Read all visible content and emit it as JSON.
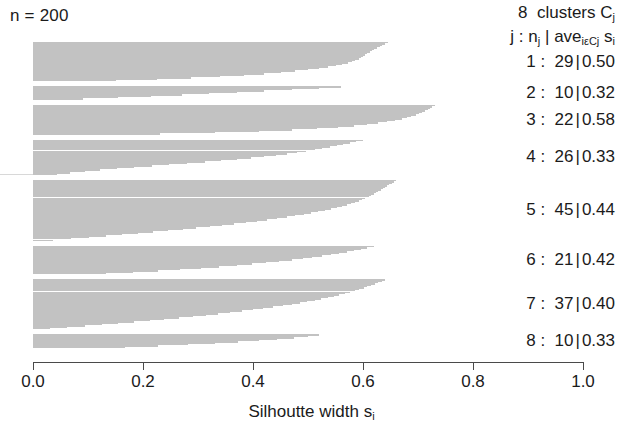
{
  "caption": {
    "n_label": "n = 200"
  },
  "legend": {
    "title_prefix": "8",
    "title_word": "clusters",
    "title_symbol": "C",
    "title_symbol_sub": "j",
    "header_j": "j",
    "header_colon": ":",
    "header_n": "n",
    "header_n_sub": "j",
    "header_bar": "|",
    "header_ave": "ave",
    "header_ave_sub": "iεCj",
    "header_s": "s",
    "header_s_sub": "i",
    "rows": [
      {
        "j": "1",
        "n": "29",
        "ave": "0.50"
      },
      {
        "j": "2",
        "n": "10",
        "ave": "0.32"
      },
      {
        "j": "3",
        "n": "22",
        "ave": "0.58"
      },
      {
        "j": "4",
        "n": "26",
        "ave": "0.33"
      },
      {
        "j": "5",
        "n": "45",
        "ave": "0.44"
      },
      {
        "j": "6",
        "n": "21",
        "ave": "0.42"
      },
      {
        "j": "7",
        "n": "37",
        "ave": "0.40"
      },
      {
        "j": "8",
        "n": "10",
        "ave": "0.33"
      }
    ]
  },
  "axis": {
    "title_text": "Silhoutte width s",
    "title_sub": "i",
    "ticks": [
      "0.0",
      "0.2",
      "0.4",
      "0.6",
      "0.8",
      "1.0"
    ],
    "tick_values": [
      0.0,
      0.2,
      0.4,
      0.6,
      0.8,
      1.0
    ],
    "min": 0.0,
    "max": 1.0
  },
  "colors": {
    "bar_fill": "#c2c2c2",
    "axis": "#4a4a4a",
    "text": "#1b1b1b",
    "background": "#ffffff"
  },
  "chart_data": {
    "type": "bar",
    "orientation": "horizontal",
    "title": "",
    "subtitle": "n = 200",
    "xlabel": "Silhoutte width s_i",
    "ylabel": "",
    "xlim": [
      0.0,
      1.0
    ],
    "grid": false,
    "legend_position": "right",
    "n_total": 200,
    "n_clusters": 8,
    "cluster_summary": [
      {
        "j": 1,
        "size": 29,
        "avg_silhouette": 0.5
      },
      {
        "j": 2,
        "size": 10,
        "avg_silhouette": 0.32
      },
      {
        "j": 3,
        "size": 22,
        "avg_silhouette": 0.58
      },
      {
        "j": 4,
        "size": 26,
        "avg_silhouette": 0.33
      },
      {
        "j": 5,
        "size": 45,
        "avg_silhouette": 0.44
      },
      {
        "j": 6,
        "size": 21,
        "avg_silhouette": 0.42
      },
      {
        "j": 7,
        "size": 37,
        "avg_silhouette": 0.4
      },
      {
        "j": 8,
        "size": 10,
        "avg_silhouette": 0.33
      }
    ],
    "clusters": [
      {
        "j": 1,
        "size": 29,
        "avg_silhouette": 0.5,
        "values": [
          0.645,
          0.64,
          0.635,
          0.63,
          0.625,
          0.62,
          0.616,
          0.612,
          0.608,
          0.604,
          0.6,
          0.596,
          0.592,
          0.586,
          0.58,
          0.572,
          0.562,
          0.55,
          0.536,
          0.52,
          0.5,
          0.476,
          0.45,
          0.42,
          0.384,
          0.34,
          0.288,
          0.226,
          0.15
        ]
      },
      {
        "j": 2,
        "size": 10,
        "avg_silhouette": 0.32,
        "values": [
          0.56,
          0.52,
          0.47,
          0.42,
          0.37,
          0.32,
          0.27,
          0.215,
          0.155,
          0.09
        ]
      },
      {
        "j": 3,
        "size": 22,
        "avg_silhouette": 0.58,
        "values": [
          0.73,
          0.726,
          0.722,
          0.718,
          0.713,
          0.708,
          0.702,
          0.696,
          0.688,
          0.68,
          0.67,
          0.658,
          0.644,
          0.628,
          0.608,
          0.584,
          0.554,
          0.516,
          0.47,
          0.41,
          0.33,
          0.23
        ]
      },
      {
        "j": 4,
        "size": 26,
        "avg_silhouette": 0.33,
        "values": [
          0.6,
          0.588,
          0.576,
          0.564,
          0.552,
          0.54,
          0.526,
          0.512,
          0.496,
          0.48,
          0.462,
          0.442,
          0.42,
          0.396,
          0.37,
          0.342,
          0.312,
          0.28,
          0.248,
          0.216,
          0.184,
          0.152,
          0.122,
          0.094,
          0.068,
          0.044
        ]
      },
      {
        "j": 5,
        "size": 45,
        "avg_silhouette": 0.44,
        "values": [
          0.66,
          0.656,
          0.652,
          0.648,
          0.644,
          0.64,
          0.636,
          0.632,
          0.628,
          0.624,
          0.62,
          0.615,
          0.61,
          0.604,
          0.598,
          0.592,
          0.585,
          0.578,
          0.57,
          0.561,
          0.552,
          0.542,
          0.531,
          0.519,
          0.506,
          0.492,
          0.477,
          0.461,
          0.444,
          0.426,
          0.407,
          0.387,
          0.366,
          0.344,
          0.321,
          0.297,
          0.272,
          0.246,
          0.219,
          0.191,
          0.162,
          0.132,
          0.101,
          0.069,
          0.036
        ]
      },
      {
        "j": 6,
        "size": 21,
        "avg_silhouette": 0.42,
        "values": [
          0.62,
          0.608,
          0.596,
          0.583,
          0.57,
          0.556,
          0.541,
          0.525,
          0.508,
          0.49,
          0.47,
          0.448,
          0.424,
          0.398,
          0.37,
          0.339,
          0.305,
          0.268,
          0.227,
          0.182,
          0.132
        ]
      },
      {
        "j": 7,
        "size": 37,
        "avg_silhouette": 0.4,
        "values": [
          0.64,
          0.634,
          0.628,
          0.622,
          0.615,
          0.608,
          0.601,
          0.593,
          0.585,
          0.576,
          0.567,
          0.557,
          0.547,
          0.536,
          0.524,
          0.512,
          0.499,
          0.485,
          0.47,
          0.454,
          0.437,
          0.419,
          0.4,
          0.38,
          0.359,
          0.337,
          0.314,
          0.29,
          0.265,
          0.239,
          0.212,
          0.184,
          0.155,
          0.125,
          0.094,
          0.062,
          0.03
        ]
      },
      {
        "j": 8,
        "size": 10,
        "avg_silhouette": 0.33,
        "values": [
          0.52,
          0.5,
          0.474,
          0.444,
          0.41,
          0.372,
          0.33,
          0.282,
          0.228,
          0.168
        ]
      }
    ]
  }
}
